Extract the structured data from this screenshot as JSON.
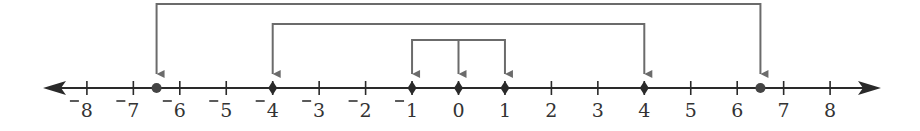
{
  "diagram": {
    "type": "number-line",
    "axis": {
      "min": -8,
      "max": 8,
      "tick_step": 1,
      "arrows": "both",
      "tick_labels": [
        "-8",
        "-7",
        "-6",
        "-5",
        "-4",
        "-3",
        "-2",
        "-1",
        "0",
        "1",
        "2",
        "3",
        "4",
        "5",
        "6",
        "7",
        "8"
      ]
    },
    "points": [
      {
        "value": -6.5,
        "style": "dot",
        "label": ""
      },
      {
        "value": -4,
        "style": "diamond",
        "label": ""
      },
      {
        "value": -1,
        "style": "diamond",
        "label": ""
      },
      {
        "value": 0,
        "style": "diamond",
        "label": ""
      },
      {
        "value": 1,
        "style": "diamond",
        "label": ""
      },
      {
        "value": 4,
        "style": "diamond",
        "label": ""
      },
      {
        "value": 6.5,
        "style": "dot",
        "label": ""
      }
    ],
    "brackets": [
      {
        "name": "outer",
        "from": -6.5,
        "to": 6.5,
        "stems": [
          -6.5,
          6.5
        ]
      },
      {
        "name": "middle",
        "from": -4,
        "to": 4,
        "stems": [
          -4,
          4
        ]
      },
      {
        "name": "inner",
        "from": -1,
        "to": 1,
        "stems": [
          -1,
          0,
          1
        ]
      }
    ],
    "colors": {
      "axis": "#2a2a2a",
      "bracket": "#6b6b6b",
      "point": "#2a2a2a",
      "dot": "#444444",
      "text": "#333333"
    }
  }
}
